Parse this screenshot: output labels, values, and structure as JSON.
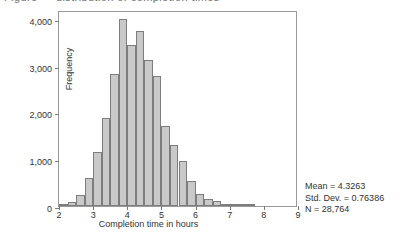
{
  "figure": {
    "top_cropped_text": "Figure — distribution of completion times",
    "frame_color": "#9a9a9a",
    "bar_fill": "#c9c9c9",
    "bar_stroke": "#7d7d7d"
  },
  "stats": {
    "mean_line": "Mean = 4.3263",
    "std_line": "Std. Dev. = 0.76386",
    "n_line": "N = 28,764"
  },
  "chart_data": {
    "type": "bar",
    "title": "",
    "xlabel": "Completion time in hours",
    "ylabel": "Frequency",
    "xlim": [
      2,
      9
    ],
    "ylim": [
      0,
      4200
    ],
    "xticks": [
      2,
      3,
      4,
      5,
      6,
      7,
      8,
      9
    ],
    "xtick_labels": [
      "2",
      "3",
      "4",
      "5",
      "6",
      "7",
      "8",
      "9"
    ],
    "yticks": [
      0,
      1000,
      2000,
      3000,
      4000
    ],
    "ytick_labels": [
      "0",
      "1,000",
      "2,000",
      "3,000",
      "4,000"
    ],
    "grid": false,
    "legend": null,
    "bin_width": 0.25,
    "bin_starts": [
      2.0,
      2.25,
      2.5,
      2.75,
      3.0,
      3.25,
      3.5,
      3.75,
      4.0,
      4.25,
      4.5,
      4.75,
      5.0,
      5.25,
      5.5,
      5.75,
      6.0,
      6.25,
      6.5,
      6.75,
      7.0,
      7.25,
      7.5
    ],
    "categories": [
      "2.00-2.25",
      "2.25-2.50",
      "2.50-2.75",
      "2.75-3.00",
      "3.00-3.25",
      "3.25-3.50",
      "3.50-3.75",
      "3.75-4.00",
      "4.00-4.25",
      "4.25-4.50",
      "4.50-4.75",
      "4.75-5.00",
      "5.00-5.25",
      "5.25-5.50",
      "5.50-5.75",
      "5.75-6.00",
      "6.00-6.25",
      "6.25-6.50",
      "6.50-6.75",
      "6.75-7.00",
      "7.00-7.25",
      "7.25-7.50",
      "7.50-7.75"
    ],
    "values": [
      30,
      90,
      240,
      600,
      1160,
      1880,
      2830,
      4000,
      3440,
      3750,
      3130,
      2780,
      1720,
      1310,
      960,
      530,
      260,
      140,
      110,
      50,
      25,
      12,
      6
    ],
    "annotations": [
      "Mean = 4.3263",
      "Std. Dev. = 0.76386",
      "N = 28,764"
    ]
  }
}
